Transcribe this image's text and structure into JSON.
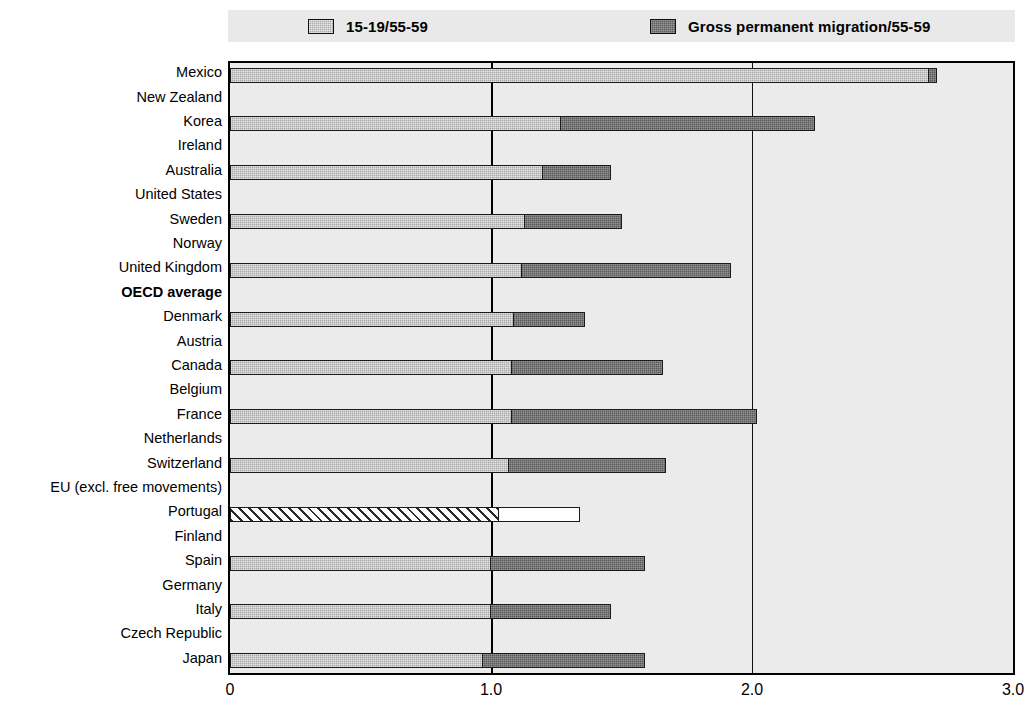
{
  "legend": {
    "items": [
      {
        "label": "15-19/55-59",
        "swatch": "light",
        "color": "#a8a8a8"
      },
      {
        "label": "Gross permanent migration/55-59",
        "swatch": "dark",
        "color": "#5a5a5a"
      }
    ]
  },
  "axis": {
    "ticks": [
      "0",
      "1.0",
      "2.0",
      "3.0"
    ],
    "tick_values": [
      0,
      1.0,
      2.0,
      3.0
    ],
    "xmin": 0,
    "xmax": 3.0
  },
  "chart_data": {
    "type": "bar",
    "orientation": "horizontal",
    "title": "",
    "subtitle": "",
    "xlabel": "",
    "ylabel": "",
    "xlim": [
      0,
      3.0
    ],
    "grid": true,
    "gridlines": [
      1.0,
      2.0
    ],
    "legend_position": "top",
    "categories": [
      "Mexico",
      "New Zealand",
      "Korea",
      "Ireland",
      "Australia",
      "United States",
      "Sweden",
      "Norway",
      "United Kingdom",
      "OECD average",
      "Denmark",
      "Austria",
      "Canada",
      "Belgium",
      "France",
      "Netherlands",
      "Switzerland",
      "EU (excl. free movements)",
      "Portugal",
      "Finland",
      "Spain",
      "Germany",
      "Italy",
      "Czech Republic",
      "Japan"
    ],
    "series": [
      {
        "name": "15-19/55-59",
        "style": "light",
        "values": [
          2.68,
          1.27,
          1.2,
          1.13,
          1.12,
          1.09,
          1.08,
          1.08,
          1.07,
          1.03,
          1.0,
          1.0,
          0.97,
          0.95,
          0.93,
          0.93,
          0.91,
          0.89,
          0.86,
          0.86,
          0.85,
          0.81,
          0.8,
          0.79,
          0.69
        ]
      },
      {
        "name": "Gross permanent migration/55-59",
        "style": "dark",
        "values": [
          2.71,
          2.24,
          1.46,
          1.5,
          1.92,
          1.36,
          1.66,
          2.02,
          1.67,
          1.34,
          1.59,
          1.46,
          1.59,
          1.21,
          1.16,
          1.37,
          2.09,
          1.14,
          1.25,
          1.09,
          1.42,
          1.01,
          1.25,
          1.0,
          0.71
        ]
      }
    ],
    "highlight_category": "OECD average",
    "highlight_note": "OECD average drawn with hatched and open (unfilled) bars"
  },
  "colors": {
    "plot_background": "#ebebeb",
    "legend_background": "#e9e9e9",
    "frame": "#000000",
    "light_bar": "#a8a8a8",
    "dark_bar": "#5a5a5a",
    "page_background": "#ffffff"
  }
}
